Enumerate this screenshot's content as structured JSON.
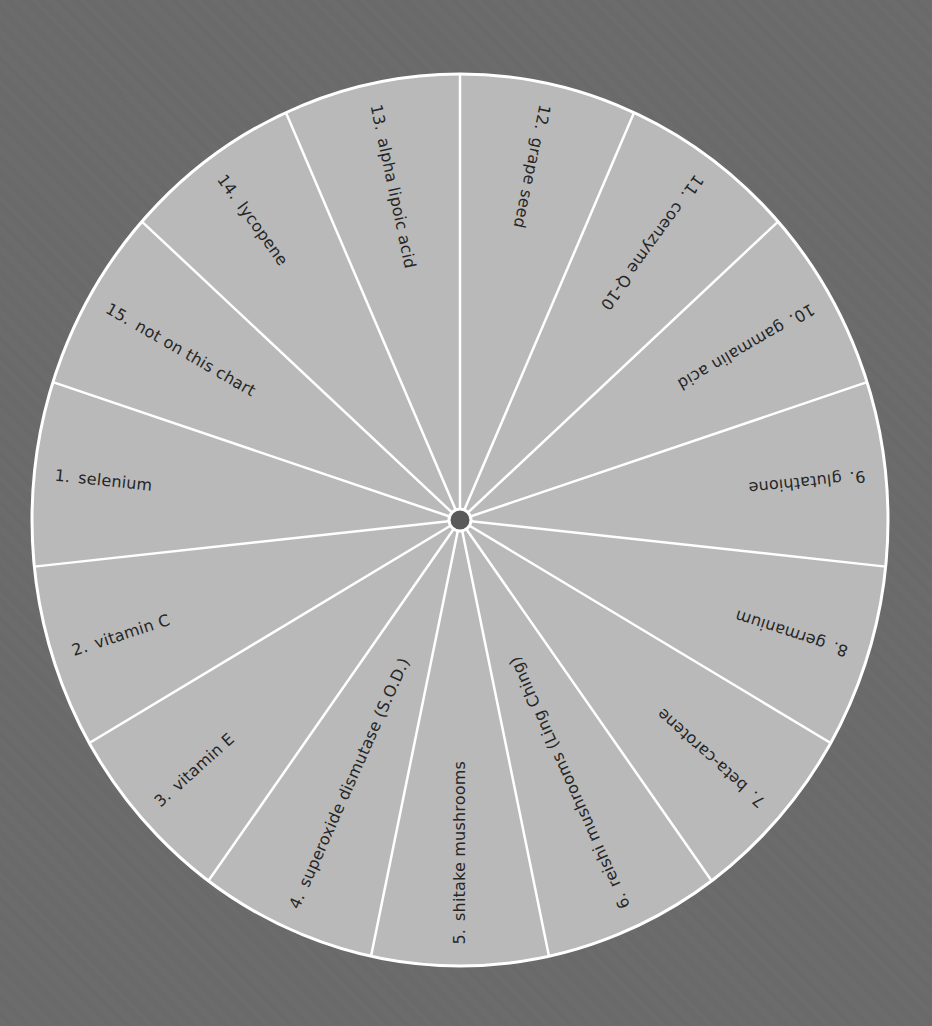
{
  "wheel": {
    "center": {
      "x": 460,
      "y": 520
    },
    "radius_x": 428,
    "radius_y": 446,
    "fill_color": "#b9b9b9",
    "line_color": "#ffffff",
    "background_color": "#6a6a6a",
    "hub_color": "#5a5a5a",
    "text_color": "#262626",
    "segments": [
      {
        "number": "1.",
        "label": "selenium"
      },
      {
        "number": "2.",
        "label": "vitamin C"
      },
      {
        "number": "3.",
        "label": "vitamin E"
      },
      {
        "number": "4.",
        "label": "superoxide dismutase (S.O.D.)"
      },
      {
        "number": "5.",
        "label": "shitake mushrooms"
      },
      {
        "number": "6.",
        "label": "reishi mushrooms (Ling Ching)"
      },
      {
        "number": "7.",
        "label": "beta-carotene"
      },
      {
        "number": "8.",
        "label": "germanium"
      },
      {
        "number": "9.",
        "label": "glutathione"
      },
      {
        "number": "10.",
        "label": "gammalin acid"
      },
      {
        "number": "11.",
        "label": "coenzyme Q-10"
      },
      {
        "number": "12.",
        "label": "grape seed"
      },
      {
        "number": "13.",
        "label": "alpha lipoic acid"
      },
      {
        "number": "14.",
        "label": "lycopene"
      },
      {
        "number": "15.",
        "label": "not on this chart"
      }
    ]
  }
}
